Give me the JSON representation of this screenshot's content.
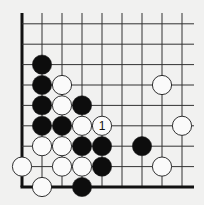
{
  "diagram": {
    "type": "go-board-corner",
    "corner": "bottom-left",
    "colors": {
      "background": "#f1f1f0",
      "line": "#333333",
      "edge": "#111111",
      "black_stone": "#0d0d0d",
      "white_stone": "#fafafa",
      "stone_outline": "#1a1a1a"
    },
    "grid": {
      "origin_x": 22,
      "origin_y": 187,
      "spacing_x": 20,
      "spacing_y": 20.4,
      "columns": 9,
      "rows": 9,
      "line_extent_right": 194,
      "line_extent_top": 13
    },
    "stones": [
      {
        "color": "black",
        "col": 1,
        "row": 2
      },
      {
        "color": "black",
        "col": 1,
        "row": 3
      },
      {
        "color": "white",
        "col": 2,
        "row": 3
      },
      {
        "color": "white",
        "col": 7,
        "row": 3
      },
      {
        "color": "black",
        "col": 1,
        "row": 4
      },
      {
        "color": "white",
        "col": 2,
        "row": 4
      },
      {
        "color": "black",
        "col": 3,
        "row": 4
      },
      {
        "color": "black",
        "col": 1,
        "row": 5
      },
      {
        "color": "black",
        "col": 2,
        "row": 5
      },
      {
        "color": "white",
        "col": 3,
        "row": 5
      },
      {
        "color": "white",
        "col": 4,
        "row": 5,
        "label": "1"
      },
      {
        "color": "white",
        "col": 8,
        "row": 5
      },
      {
        "color": "white",
        "col": 1,
        "row": 6
      },
      {
        "color": "white",
        "col": 2,
        "row": 6
      },
      {
        "color": "black",
        "col": 3,
        "row": 6
      },
      {
        "color": "black",
        "col": 4,
        "row": 6
      },
      {
        "color": "black",
        "col": 6,
        "row": 6
      },
      {
        "color": "white",
        "col": 0,
        "row": 7
      },
      {
        "color": "white",
        "col": 2,
        "row": 7
      },
      {
        "color": "white",
        "col": 3,
        "row": 7
      },
      {
        "color": "black",
        "col": 4,
        "row": 7
      },
      {
        "color": "white",
        "col": 7,
        "row": 7
      },
      {
        "color": "white",
        "col": 1,
        "row": 8
      },
      {
        "color": "black",
        "col": 3,
        "row": 8
      }
    ],
    "move_labels": [
      {
        "text": "1",
        "col": 4,
        "row": 5
      }
    ]
  }
}
